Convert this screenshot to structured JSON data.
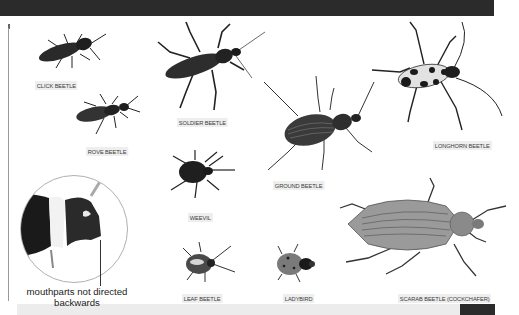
{
  "page": {
    "top_bar_color": "#2b2b2b",
    "background": "#ffffff"
  },
  "beetles": [
    {
      "id": "click",
      "label": "CLICK BEETLE"
    },
    {
      "id": "rove",
      "label": "ROVE BEETLE"
    },
    {
      "id": "soldier",
      "label": "SOLDIER BEETLE"
    },
    {
      "id": "ground",
      "label": "GROUND BEETLE"
    },
    {
      "id": "longhorn",
      "label": "LONGHORN BEETLE"
    },
    {
      "id": "weevil",
      "label": "WEEVIL"
    },
    {
      "id": "leaf",
      "label": "LEAF BEETLE"
    },
    {
      "id": "ladybird",
      "label": "LADYBIRD"
    },
    {
      "id": "scarab",
      "label": "SCARAB BEETLE (COCKCHAFER)"
    }
  ],
  "callout": {
    "line1": "mouthparts not directed",
    "line2": "backwards"
  }
}
